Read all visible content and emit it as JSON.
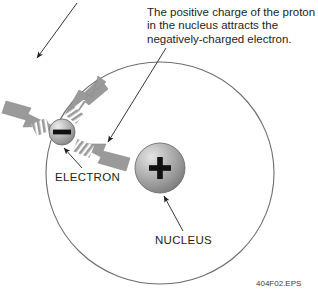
{
  "figure": {
    "title_clipped": "negatively-charged electron.",
    "id_label": "404F02.EPS",
    "background_color": "#ffffff"
  },
  "annotations": {
    "main_caption": "The positive charge of the proton\nin the nucleus attracts the\nnegatively-charged electron.",
    "main_caption_lines": [
      "The positive charge of the proton",
      "in the nucleus attracts the",
      "negatively-charged electron."
    ],
    "top_caption_clipped": ""
  },
  "labels": {
    "electron": "ELECTRON",
    "nucleus": "NUCLEUS"
  },
  "particles": {
    "electron": {
      "name": "electron",
      "symbol": "—",
      "charge_sign": "minus",
      "center_x": 62,
      "center_y": 132,
      "radius": 13,
      "fill_color": "#9a9a9a"
    },
    "nucleus": {
      "name": "nucleus",
      "symbol": "+",
      "charge_sign": "plus",
      "center_x": 160,
      "center_y": 168,
      "radius": 25,
      "fill_color": "#9a9a9a"
    }
  },
  "orbit": {
    "name": "electron-orbit",
    "center_x": 160,
    "center_y": 173,
    "radius_x": 114,
    "radius_y": 111,
    "stroke_color": "#6e6e6e"
  },
  "force_arrows": {
    "count": 3,
    "color": "#9a9a9a",
    "description": "striped motion arrows radiating from the electron",
    "directions": [
      "upper-left",
      "upper-right",
      "lower-right"
    ]
  },
  "leader_lines": {
    "count": 3,
    "color": "#231f20",
    "targets": [
      "electron",
      "electron-orbit-region",
      "nucleus"
    ]
  },
  "colors": {
    "text": "#231f20",
    "sphere_gray": "#9a9a9a",
    "sphere_highlight": "#e8e8e8",
    "orbit_stroke": "#6e6e6e",
    "arrow_gray": "#9a9a9a"
  }
}
